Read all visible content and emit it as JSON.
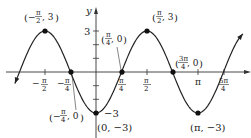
{
  "chart_data": {
    "type": "line",
    "title": "",
    "function": "y = -3 cos(2x)",
    "xlabel": "x",
    "ylabel": "y",
    "x_range": [
      -0.795,
      1.44
    ],
    "x_range_units": "pi",
    "ylim": [
      -3.4,
      3.9
    ],
    "grid": false,
    "legend": null,
    "x_ticks": [
      {
        "num": "π",
        "den": "2",
        "sign": "−",
        "value": -1.5708
      },
      {
        "num": "π",
        "den": "4",
        "sign": "−",
        "value": -0.7854
      },
      {
        "num": "π",
        "den": "4",
        "sign": "",
        "value": 0.7854
      },
      {
        "num": "π",
        "den": "2",
        "sign": "",
        "value": 1.5708
      },
      {
        "num": "π",
        "den": "",
        "sign": "",
        "value": 3.1416
      },
      {
        "num": "5π",
        "den": "4",
        "sign": "",
        "value": 3.927
      }
    ],
    "y_ticks": [
      {
        "label": "3",
        "value": 3
      },
      {
        "label": "−3",
        "value": -3
      }
    ],
    "y_minor_ticks": [
      -2,
      -1,
      1,
      2
    ],
    "points": [
      {
        "label": "(−π/2, 3)",
        "x": -1.5708,
        "y": 3
      },
      {
        "label": "(−π/4, 0)",
        "x": -0.7854,
        "y": 0
      },
      {
        "label": "(0, −3)",
        "x": 0,
        "y": -3
      },
      {
        "label": "(π/4, 0)",
        "x": 0.7854,
        "y": 0
      },
      {
        "label": "(π/2, 3)",
        "x": 1.5708,
        "y": 3
      },
      {
        "label": "(3π/4, 0)",
        "x": 2.3562,
        "y": 0
      },
      {
        "label": "(π, −3)",
        "x": 3.1416,
        "y": -3
      }
    ]
  },
  "axes": {
    "x_label": "x",
    "y_label": "y"
  },
  "annotations": {
    "p1": {
      "open": "(",
      "sign": "−",
      "num": "π",
      "den": "2",
      "rest": ", 3",
      "close": ")"
    },
    "p2": {
      "open": "(",
      "sign": "−",
      "num": "π",
      "den": "4",
      "rest": ", 0",
      "close": ")"
    },
    "p3": {
      "text": "(0, −3)"
    },
    "p4": {
      "open": "(",
      "num": "π",
      "den": "4",
      "rest": ", 0",
      "close": ")"
    },
    "p5": {
      "open": "(",
      "num": "π",
      "den": "2",
      "rest": ", 3",
      "close": ")"
    },
    "p6": {
      "open": "(",
      "num": "3π",
      "den": "4",
      "rest": ", 0",
      "close": ")"
    },
    "p7": {
      "text": "(π, −3)"
    }
  },
  "ticks": {
    "x": {
      "neg_half": {
        "sign": "−",
        "num": "π",
        "den": "2"
      },
      "neg_quarter": {
        "sign": "−",
        "num": "π",
        "den": "4"
      },
      "quarter": {
        "num": "π",
        "den": "4"
      },
      "half": {
        "num": "π",
        "den": "2"
      },
      "pi": {
        "text": "π"
      },
      "five_quarter": {
        "num": "5π",
        "den": "4"
      }
    },
    "y": {
      "three": "3",
      "neg_three": "−3"
    }
  }
}
